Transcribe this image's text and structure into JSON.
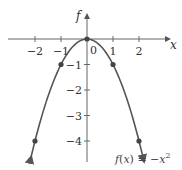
{
  "chart_data": {
    "type": "line",
    "title": "",
    "function": "f(x) = -x^2",
    "xlabel": "x",
    "ylabel": "f",
    "xlim": [
      -2.5,
      2.5
    ],
    "ylim": [
      -4.5,
      1
    ],
    "x_ticks": [
      -2,
      -1,
      1,
      2
    ],
    "x_tick_labels": [
      "−2",
      "−1",
      "1",
      "2"
    ],
    "y_ticks": [
      -1,
      -2,
      -3,
      -4
    ],
    "y_tick_labels": [
      "−1",
      "−2",
      "−3",
      "−4"
    ],
    "origin_label": "0",
    "grid": false,
    "series": [
      {
        "name": "f(x) = −x²",
        "points": [
          {
            "x": -2,
            "y": -4
          },
          {
            "x": -1,
            "y": -1
          },
          {
            "x": 0,
            "y": 0
          },
          {
            "x": 1,
            "y": -1
          },
          {
            "x": 2,
            "y": -4
          }
        ]
      }
    ],
    "annotation": {
      "text_main": "f(x)  =  −x",
      "superscript": "2"
    },
    "colors": {
      "curve": "#555555",
      "axis": "#555555",
      "points": "#444444"
    }
  }
}
